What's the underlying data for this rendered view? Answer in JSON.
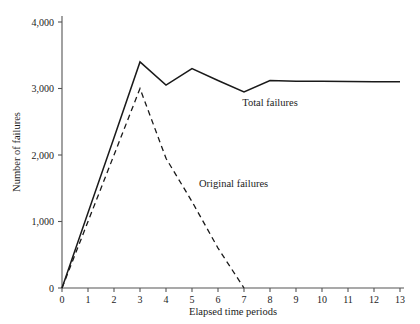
{
  "chart_data": {
    "type": "line",
    "title": "",
    "subtitle": "",
    "xlabel": "Elapsed time periods",
    "ylabel": "Number of failures",
    "xlim": [
      0,
      13
    ],
    "ylim": [
      0,
      4000
    ],
    "grid": false,
    "legend_position": "inline-annotation",
    "x_tick_labels": [
      "0",
      "1",
      "2",
      "3",
      "4",
      "5",
      "6",
      "7",
      "8",
      "9",
      "10",
      "11",
      "12",
      "13"
    ],
    "y_tick_labels": [
      "0",
      "1,000",
      "2,000",
      "3,000",
      "4,000"
    ],
    "x_ticks": [
      0,
      1,
      2,
      3,
      4,
      5,
      6,
      7,
      8,
      9,
      10,
      11,
      12,
      13
    ],
    "y_ticks": [
      0,
      1000,
      2000,
      3000,
      4000
    ],
    "x": [
      0,
      1,
      2,
      3,
      4,
      5,
      6,
      7,
      8,
      9,
      10,
      11,
      12,
      13
    ],
    "series": [
      {
        "name": "Total failures",
        "style": "solid",
        "color": "#1a1a1a",
        "x": [
          0,
          1,
          2,
          3,
          4,
          5,
          6,
          7,
          8,
          9,
          10,
          11,
          12,
          13
        ],
        "values": [
          0,
          1130,
          2260,
          3400,
          3050,
          3300,
          3120,
          2950,
          3120,
          3110,
          3110,
          3105,
          3100,
          3100
        ]
      },
      {
        "name": "Original failures",
        "style": "dashed",
        "color": "#1a1a1a",
        "x": [
          0,
          1,
          2,
          3,
          4,
          5,
          6,
          7
        ],
        "values": [
          0,
          1000,
          2000,
          3000,
          1950,
          1300,
          600,
          0
        ]
      }
    ],
    "annotations": [
      {
        "text": "Total failures",
        "x": 8.0,
        "y": 2740
      },
      {
        "text": "Original failures",
        "x": 6.6,
        "y": 1520
      }
    ]
  }
}
